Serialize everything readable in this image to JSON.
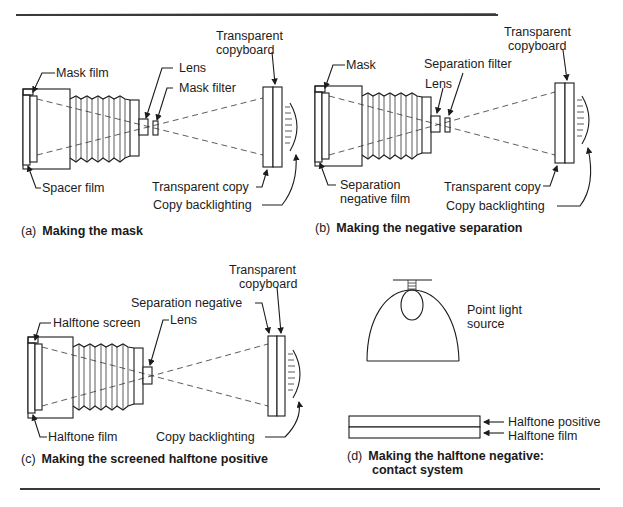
{
  "figure": {
    "panels": [
      {
        "id": "a",
        "tag": "(a)",
        "title": "Making the mask",
        "labels": {
          "top_left": "Mask film",
          "bottom_left": "Spacer film",
          "lens": "Lens",
          "filter": "Mask filter",
          "copyboard_line1": "Transparent",
          "copyboard_line2": "copyboard",
          "copy": "Transparent copy",
          "backlighting": "Copy backlighting"
        }
      },
      {
        "id": "b",
        "tag": "(b)",
        "title": "Making the negative separation",
        "labels": {
          "top_left": "Mask",
          "bottom_left_line1": "Separation",
          "bottom_left_line2": "negative film",
          "lens": "Lens",
          "filter": "Separation filter",
          "copyboard_line1": "Transparent",
          "copyboard_line2": "copyboard",
          "copy": "Transparent copy",
          "backlighting": "Copy backlighting"
        }
      },
      {
        "id": "c",
        "tag": "(c)",
        "title": "Making the screened halftone positive",
        "labels": {
          "top_left": "Halftone screen",
          "bottom_left": "Halftone film",
          "lens": "Lens",
          "negative": "Separation negative",
          "copyboard_line1": "Transparent",
          "copyboard_line2": "copyboard",
          "backlighting": "Copy backlighting"
        }
      },
      {
        "id": "d",
        "tag": "(d)",
        "title_line1": "Making the halftone negative:",
        "title_line2": "contact system",
        "labels": {
          "light_line1": "Point light",
          "light_line2": "source",
          "positive": "Halftone positive",
          "film": "Halftone film"
        }
      }
    ]
  }
}
